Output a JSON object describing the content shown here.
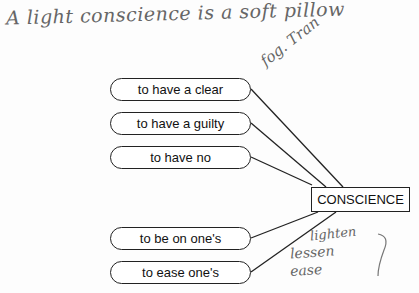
{
  "annotations": {
    "proverb": "A light conscience is a soft pillow",
    "margin_note": "fog. Tran",
    "synonyms": [
      "lighten",
      "lessen",
      "ease"
    ]
  },
  "diagram": {
    "center": "CONSCIENCE",
    "collocations": [
      {
        "label": "to have a clear",
        "top": 78
      },
      {
        "label": "to have a guilty",
        "top": 112
      },
      {
        "label": "to have no",
        "top": 146
      },
      {
        "label": "to be on one's",
        "top": 227
      },
      {
        "label": "to ease one's",
        "top": 261
      }
    ]
  }
}
